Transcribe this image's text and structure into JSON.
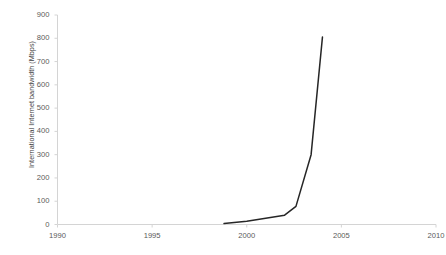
{
  "chart_data": {
    "type": "line",
    "title": "",
    "subtitle": "",
    "xlabel": "",
    "ylabel": "International Internet bandwidth (Mbps)",
    "xlim": [
      1990,
      2010
    ],
    "ylim": [
      0,
      900
    ],
    "x_ticks": [
      1990,
      1995,
      2000,
      2005,
      2010
    ],
    "x_tick_labels": [
      "1990",
      "1995",
      "2000",
      "2005",
      "2010"
    ],
    "y_ticks": [
      0,
      100,
      200,
      300,
      400,
      500,
      600,
      700,
      800,
      900
    ],
    "y_tick_labels": [
      "0",
      "100",
      "200",
      "300",
      "400",
      "500",
      "600",
      "700",
      "800",
      "900"
    ],
    "grid": false,
    "legend": false,
    "legend_position": "none",
    "line_color": "#262626",
    "axis_color": "#d4d4d4",
    "series": [
      {
        "name": "International Internet bandwidth (Mbps)",
        "x": [
          1998.8,
          2000.0,
          2002.0,
          2002.6,
          2003.4,
          2004.0
        ],
        "values": [
          4,
          14,
          40,
          78,
          300,
          805
        ]
      }
    ]
  },
  "axes": {
    "y_title": "International Internet bandwidth (Mbps)"
  }
}
